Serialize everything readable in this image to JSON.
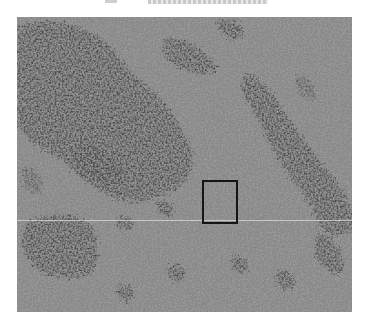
{
  "caption": {
    "text": "",
    "note": "cut-off caption line at top edge"
  },
  "figure": {
    "type": "grayscale micrograph",
    "background_color": "#a0a0a0",
    "dark_region_color": "#3a3a3a",
    "roi_box": {
      "label": "",
      "border_color": "#151515"
    },
    "scan_line_color": "#d6d6d6"
  }
}
